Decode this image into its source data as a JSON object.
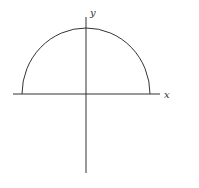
{
  "diagram": {
    "x_axis_label": "x",
    "y_axis_label": "y",
    "curve": "semicircle",
    "colors": {
      "stroke": "#333333",
      "background": "#ffffff"
    }
  }
}
